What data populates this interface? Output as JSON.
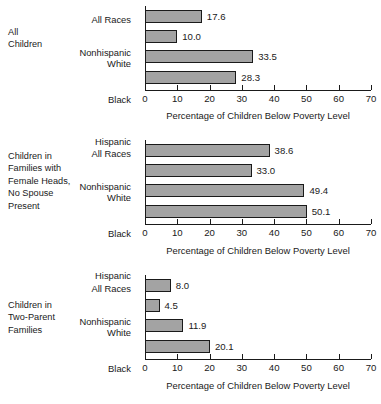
{
  "chart_data": [
    {
      "type": "bar",
      "orientation": "horizontal",
      "title": "All Children",
      "categories": [
        "All Races",
        "Nonhispanic White",
        "Black",
        "Hispanic"
      ],
      "values": [
        17.6,
        10.0,
        33.5,
        28.3
      ],
      "value_labels": [
        "17.6",
        "10.0",
        "33.5",
        "28.3"
      ],
      "xlabel": "Percentage of Children Below Poverty Level",
      "ylabel": "",
      "xlim": [
        0,
        70
      ],
      "xticks": [
        0,
        10,
        20,
        30,
        40,
        50,
        60,
        70
      ],
      "xtick_labels": [
        "0",
        "10",
        "20",
        "30",
        "40",
        "50",
        "60",
        "70"
      ],
      "grid": false,
      "legend": false,
      "bar_color": "#a3a3a3",
      "bar_edge_color": "#1a1a1a"
    },
    {
      "type": "bar",
      "orientation": "horizontal",
      "title": "Children in Families with Female Heads, No Spouse Present",
      "categories": [
        "All Races",
        "Nonhispanic White",
        "Black",
        "Hispanic"
      ],
      "values": [
        38.6,
        33.0,
        49.4,
        50.1
      ],
      "value_labels": [
        "38.6",
        "33.0",
        "49.4",
        "50.1"
      ],
      "xlabel": "Percentage of Children Below Poverty Level",
      "ylabel": "",
      "xlim": [
        0,
        70
      ],
      "xticks": [
        0,
        10,
        20,
        30,
        40,
        50,
        60,
        70
      ],
      "xtick_labels": [
        "0",
        "10",
        "20",
        "30",
        "40",
        "50",
        "60",
        "70"
      ],
      "grid": false,
      "legend": false,
      "bar_color": "#a3a3a3",
      "bar_edge_color": "#1a1a1a"
    },
    {
      "type": "bar",
      "orientation": "horizontal",
      "title": "Children in Two-Parent Families",
      "categories": [
        "All Races",
        "Nonhispanic White",
        "Black",
        "Hispanic"
      ],
      "values": [
        8.0,
        4.5,
        11.9,
        20.1
      ],
      "value_labels": [
        "8.0",
        "4.5",
        "11.9",
        "20.1"
      ],
      "xlabel": "Percentage of Children Below Poverty Level",
      "ylabel": "",
      "xlim": [
        0,
        70
      ],
      "xticks": [
        0,
        10,
        20,
        30,
        40,
        50,
        60,
        70
      ],
      "xtick_labels": [
        "0",
        "10",
        "20",
        "30",
        "40",
        "50",
        "60",
        "70"
      ],
      "grid": false,
      "legend": false,
      "bar_color": "#a3a3a3",
      "bar_edge_color": "#1a1a1a"
    }
  ],
  "panels": [
    {
      "title": "All\nChildren"
    },
    {
      "title": "Children in\nFamilies with\nFemale Heads,\nNo Spouse\nPresent"
    },
    {
      "title": "Children in\nTwo-Parent\nFamilies"
    }
  ],
  "category_display": [
    "All Races",
    "Nonhispanic\nWhite",
    "Black",
    "Hispanic"
  ]
}
